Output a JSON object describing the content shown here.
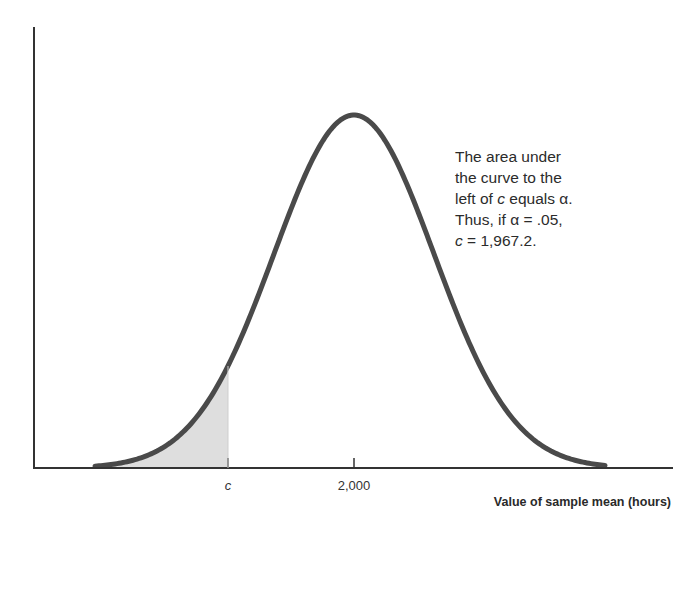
{
  "chart_data": {
    "type": "area",
    "title": "",
    "xlabel": "Value of sample mean (hours)",
    "ylabel": "",
    "distribution": "normal",
    "mean": 2000,
    "critical_value_c": 1967.2,
    "alpha": 0.05,
    "tick_labels": [
      "c",
      "2,000"
    ],
    "shaded_region": "area under curve to the left of c",
    "annotation": [
      "The area under",
      "the curve to the",
      "left of c equals α.",
      "Thus, if α = .05,",
      "c = 1,967.2."
    ],
    "grid": false,
    "legend": "none"
  },
  "axis": {
    "tick_c": "c",
    "tick_mean": "2,000",
    "xlabel": "Value of sample mean (hours)"
  },
  "annotation": {
    "line1": "The area under",
    "line2": "the curve to the",
    "line3_pre": "left of ",
    "line3_c": "c",
    "line3_post": " equals α.",
    "line4": "Thus, if α = .05,",
    "line5_c": "c",
    "line5_post": " = 1,967.2."
  },
  "colors": {
    "curve": "#4a4a4a",
    "axis": "#333333",
    "shade": "#dcdcdc"
  }
}
